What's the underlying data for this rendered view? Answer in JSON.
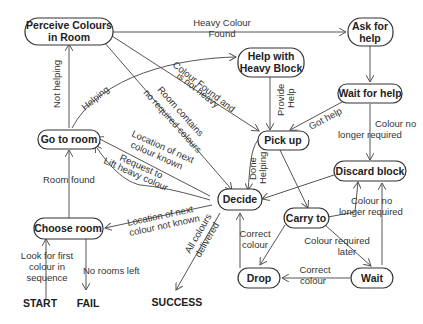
{
  "nodes": {
    "perceive": [
      "Perceive Colours",
      "in Room"
    ],
    "ask": [
      "Ask for",
      "help"
    ],
    "help_heavy": [
      "Help with",
      "Heavy Block"
    ],
    "wait_help": "Wait for help",
    "go_room": "Go to room",
    "pick_up": "Pick up",
    "discard": "Discard block",
    "decide": "Decide",
    "carry": "Carry to",
    "choose": "Choose room",
    "drop": "Drop",
    "wait": "Wait"
  },
  "terminals": {
    "start": "START",
    "fail": "FAIL",
    "success": "SUCCESS"
  },
  "edges": {
    "heavy_found": [
      "Heavy Colour",
      "Found"
    ],
    "not_helping": "Not helping",
    "helping": "Helping",
    "colour_found_not_heavy": [
      "Colour Found and",
      "is not heavy"
    ],
    "room_no_colours": [
      "Room contains",
      "no required colours"
    ],
    "provide_help": [
      "Provide",
      "Help"
    ],
    "got_help": "Got help",
    "no_longer_required_1": [
      "Colour no",
      "longer required"
    ],
    "location_known": [
      "Location of next",
      "colour known"
    ],
    "request_lift": [
      "Request to",
      "Lift heavy colour"
    ],
    "done_helping": [
      "Done",
      "Helping"
    ],
    "room_found": "Room found",
    "location_not_known": [
      "Location of next",
      "colour not known"
    ],
    "no_longer_required_2": [
      "Colour no",
      "longer required"
    ],
    "look_first": [
      "Look for first",
      "colour in",
      "sequence"
    ],
    "no_rooms_left": "No rooms left",
    "all_delivered": [
      "All colours",
      "delivered"
    ],
    "correct_colour_1": [
      "Correct",
      "colour"
    ],
    "required_later": [
      "Colour required",
      "later"
    ],
    "correct_colour_2": [
      "Correct",
      "colour"
    ]
  }
}
